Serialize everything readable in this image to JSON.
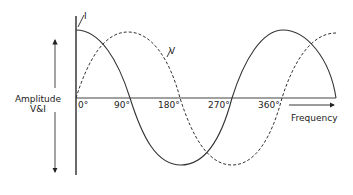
{
  "diagram": {
    "title": "",
    "y_axis_label_line1": "Amplitude",
    "y_axis_label_line2": "V&I",
    "x_axis_label": "Frequency",
    "ticks": [
      "0°",
      "90°",
      "180°",
      "270°",
      "360°"
    ],
    "curves": [
      {
        "name": "I",
        "label": "I",
        "style": "solid",
        "shape": "cosine",
        "description": "Current"
      },
      {
        "name": "V",
        "label": "V",
        "style": "dashed",
        "shape": "sine",
        "description": "Voltage"
      }
    ],
    "colors": {
      "line": "#333333",
      "background": "#ffffff"
    }
  }
}
